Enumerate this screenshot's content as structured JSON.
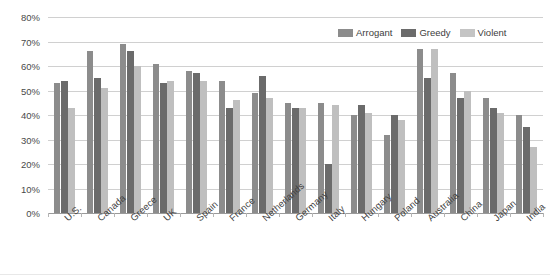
{
  "chart_data": {
    "type": "bar",
    "title": "",
    "subtitle": "",
    "xlabel": "",
    "ylabel": "",
    "ylim": [
      0,
      80
    ],
    "ytick_labels": [
      "80%",
      "70%",
      "60%",
      "50%",
      "40%",
      "30%",
      "20%",
      "10%",
      "0%"
    ],
    "ytick_values": [
      80,
      70,
      60,
      50,
      40,
      30,
      20,
      10,
      0
    ],
    "grid": true,
    "legend_position": "top-right",
    "categories": [
      "U.S.",
      "Canada",
      "Greece",
      "UK",
      "Spain",
      "France",
      "Netherlands",
      "Germany",
      "Italy",
      "Hungary",
      "Poland",
      "Australia",
      "China",
      "Japan",
      "India"
    ],
    "series": [
      {
        "name": "Arrogant",
        "color": "#8c8c8c",
        "values": [
          53,
          66,
          69,
          61,
          58,
          54,
          49,
          45,
          45,
          40,
          32,
          67,
          57,
          47,
          40
        ]
      },
      {
        "name": "Greedy",
        "color": "#6b6b6b",
        "values": [
          54,
          55,
          66,
          53,
          57,
          43,
          56,
          43,
          20,
          44,
          40,
          55,
          47,
          43,
          35
        ]
      },
      {
        "name": "Violent",
        "color": "#bfbfbf",
        "values": [
          43,
          51,
          60,
          54,
          54,
          46,
          47,
          43,
          44,
          41,
          38,
          67,
          50,
          41,
          27
        ]
      }
    ]
  },
  "legend": {
    "entries": [
      {
        "label": "Arrogant",
        "swatch": "legend-swatch-arrogant"
      },
      {
        "label": "Greedy",
        "swatch": "legend-swatch-greedy"
      },
      {
        "label": "Violent",
        "swatch": "legend-swatch-violent"
      }
    ]
  }
}
